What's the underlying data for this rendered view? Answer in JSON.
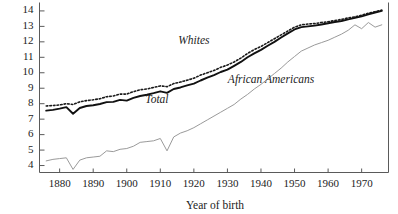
{
  "chart_data": {
    "type": "line",
    "title": "",
    "xlabel": "Year of birth",
    "ylabel": "",
    "xlim": [
      1874,
      1978
    ],
    "ylim": [
      3.55,
      14.35
    ],
    "grid": false,
    "legend_position": "inline-annotations",
    "xticks": [
      1880,
      1890,
      1900,
      1910,
      1920,
      1930,
      1940,
      1950,
      1960,
      1970
    ],
    "xtick_labels": [
      "1880",
      "1890",
      "1900",
      "1910",
      "1920",
      "1930",
      "1940",
      "1950",
      "1960",
      "1970"
    ],
    "yticks": [
      4,
      5,
      6,
      7,
      8,
      9,
      10,
      11,
      12,
      13,
      14
    ],
    "ytick_labels": [
      "4",
      "5",
      "6",
      "7",
      "8",
      "9",
      "10",
      "11",
      "12",
      "13",
      "14"
    ],
    "annotations": [
      {
        "text": "Whites",
        "x": 1920,
        "y": 11.85
      },
      {
        "text": "Total",
        "x": 1909,
        "y": 8.05
      },
      {
        "text": "African Americans",
        "x": 1943,
        "y": 9.35
      }
    ],
    "series": [
      {
        "name": "Whites",
        "style": "dotted",
        "color": "#1a1a1a",
        "x": [
          1876,
          1878,
          1880,
          1882,
          1884,
          1886,
          1888,
          1890,
          1892,
          1894,
          1896,
          1898,
          1900,
          1902,
          1904,
          1906,
          1908,
          1910,
          1912,
          1914,
          1916,
          1918,
          1920,
          1922,
          1924,
          1926,
          1928,
          1930,
          1932,
          1934,
          1936,
          1938,
          1940,
          1942,
          1944,
          1946,
          1948,
          1950,
          1952,
          1954,
          1956,
          1958,
          1960,
          1962,
          1964,
          1966,
          1968,
          1970,
          1972,
          1974,
          1976
        ],
        "values": [
          7.85,
          7.88,
          7.92,
          8.0,
          7.95,
          8.12,
          8.2,
          8.25,
          8.32,
          8.45,
          8.5,
          8.62,
          8.62,
          8.78,
          8.9,
          8.95,
          9.05,
          9.15,
          9.1,
          9.3,
          9.4,
          9.52,
          9.65,
          9.85,
          10.0,
          10.15,
          10.35,
          10.5,
          10.7,
          10.95,
          11.25,
          11.5,
          11.7,
          11.95,
          12.2,
          12.45,
          12.7,
          12.95,
          13.1,
          13.15,
          13.18,
          13.25,
          13.3,
          13.38,
          13.45,
          13.55,
          13.62,
          13.72,
          13.85,
          13.95,
          14.05
        ]
      },
      {
        "name": "Total",
        "style": "solid",
        "color": "#111111",
        "x": [
          1876,
          1878,
          1880,
          1882,
          1884,
          1886,
          1888,
          1890,
          1892,
          1894,
          1896,
          1898,
          1900,
          1902,
          1904,
          1906,
          1908,
          1910,
          1912,
          1914,
          1916,
          1918,
          1920,
          1922,
          1924,
          1926,
          1928,
          1930,
          1932,
          1934,
          1936,
          1938,
          1940,
          1942,
          1944,
          1946,
          1948,
          1950,
          1952,
          1954,
          1956,
          1958,
          1960,
          1962,
          1964,
          1966,
          1968,
          1970,
          1972,
          1974,
          1976
        ],
        "values": [
          7.55,
          7.6,
          7.68,
          7.78,
          7.35,
          7.72,
          7.85,
          7.9,
          7.98,
          8.1,
          8.12,
          8.25,
          8.2,
          8.38,
          8.5,
          8.58,
          8.68,
          8.8,
          8.7,
          8.95,
          9.05,
          9.18,
          9.3,
          9.5,
          9.68,
          9.85,
          10.05,
          10.2,
          10.45,
          10.7,
          11.0,
          11.25,
          11.48,
          11.75,
          12.0,
          12.28,
          12.55,
          12.8,
          12.95,
          13.0,
          13.05,
          13.12,
          13.2,
          13.28,
          13.35,
          13.45,
          13.55,
          13.65,
          13.78,
          13.9,
          14.0
        ]
      },
      {
        "name": "African Americans",
        "style": "solid-thin",
        "color": "#9a9a9a",
        "x": [
          1876,
          1878,
          1880,
          1882,
          1884,
          1886,
          1888,
          1890,
          1892,
          1894,
          1896,
          1898,
          1900,
          1902,
          1904,
          1906,
          1908,
          1910,
          1912,
          1914,
          1916,
          1918,
          1920,
          1922,
          1924,
          1926,
          1928,
          1930,
          1932,
          1934,
          1936,
          1938,
          1940,
          1942,
          1944,
          1946,
          1948,
          1950,
          1952,
          1954,
          1956,
          1958,
          1960,
          1962,
          1964,
          1966,
          1968,
          1970,
          1972,
          1974,
          1976
        ],
        "values": [
          4.3,
          4.4,
          4.45,
          4.5,
          3.75,
          4.35,
          4.5,
          4.55,
          4.6,
          4.95,
          4.9,
          5.05,
          5.1,
          5.25,
          5.5,
          5.55,
          5.6,
          5.75,
          4.95,
          5.85,
          6.1,
          6.25,
          6.45,
          6.7,
          6.95,
          7.2,
          7.45,
          7.7,
          7.95,
          8.3,
          8.6,
          8.95,
          9.25,
          9.6,
          9.95,
          10.3,
          10.7,
          11.05,
          11.4,
          11.6,
          11.8,
          11.95,
          12.1,
          12.3,
          12.5,
          12.75,
          13.1,
          12.85,
          13.25,
          12.95,
          13.1
        ]
      }
    ]
  },
  "axes": {
    "x_title": "Year of birth"
  }
}
